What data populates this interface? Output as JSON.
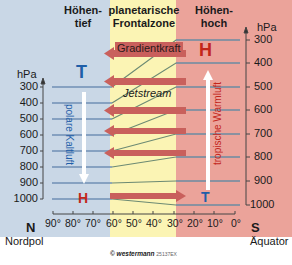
{
  "colors": {
    "polar_bg": "#c9d7e6",
    "front_bg": "#fbf4b4",
    "tropical_bg": "#eba39a",
    "isobar_blue": "#6f8fb5",
    "isobar_green": "#6c8a73",
    "arrow_red": "#c9605c",
    "H_red": "#c3261b",
    "T_blue": "#1f5ea8"
  },
  "headers": {
    "polar": [
      "Höhen-",
      "tief"
    ],
    "front": [
      "planetarische",
      "Frontalzone"
    ],
    "tropical": [
      "Höhen-",
      "hoch"
    ]
  },
  "left_axis": {
    "unit": "hPa",
    "ticks": [
      "300",
      "400",
      "500",
      "600",
      "700",
      "800",
      "900",
      "1000"
    ]
  },
  "right_axis": {
    "unit": "hPa",
    "ticks": [
      "300",
      "400",
      "500",
      "600",
      "700",
      "800",
      "900",
      "1000"
    ]
  },
  "lat_axis": {
    "ticks": [
      "90°",
      "80°",
      "70°",
      "60°",
      "50°",
      "40°",
      "30°",
      "20°",
      "10°",
      "0°"
    ],
    "left_letter": "N",
    "left_label": "Nordpol",
    "right_letter": "S",
    "right_label": "Äquator"
  },
  "labels": {
    "gradient_force": "Gradientkraft",
    "jetstream": "Jetstream",
    "polar_air": "polare Kaltluft",
    "tropical_air": "tropische Warmluft",
    "high_upper": "H",
    "low_upper": "T",
    "high_surface": "H",
    "low_surface": "T"
  },
  "credit": {
    "brand": "© westermann",
    "code": "25137EX"
  }
}
